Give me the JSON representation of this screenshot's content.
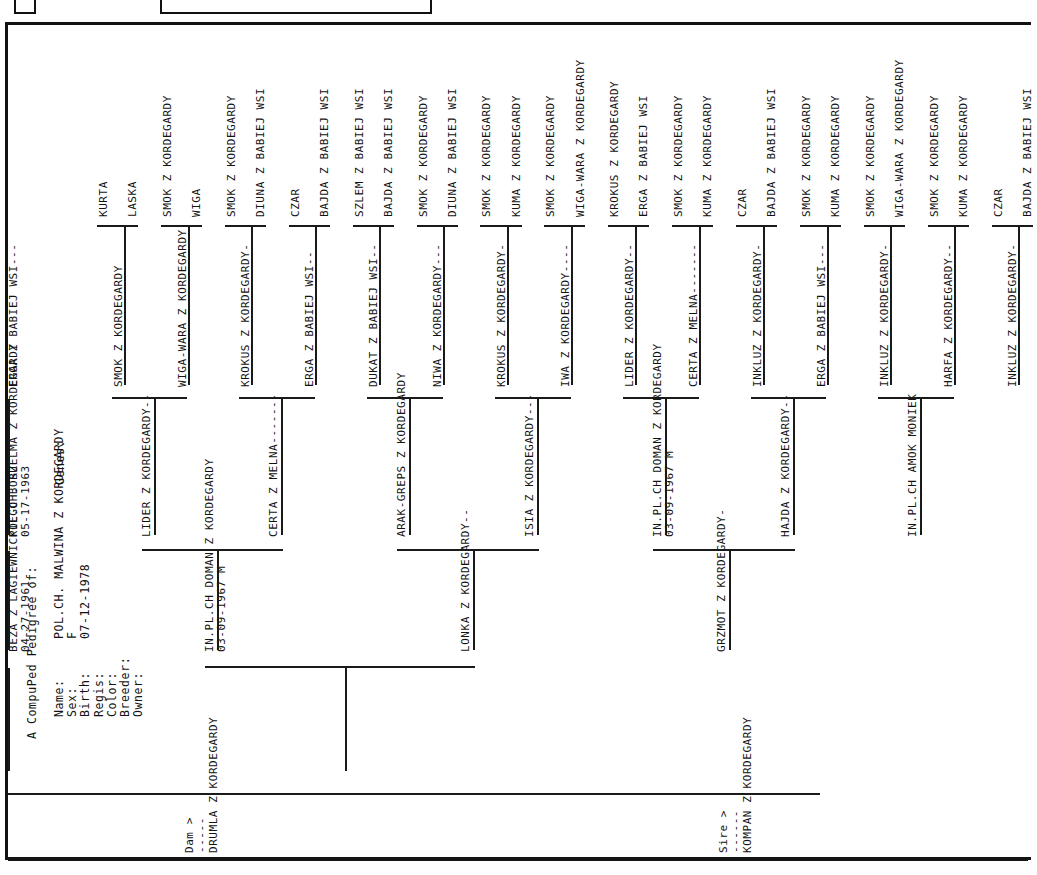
{
  "document": {
    "title": "A CompuPed Pedigree of:",
    "fields": [
      {
        "label": "Name:",
        "value": "POL.CH. MALWINA Z KORDEGARDY"
      },
      {
        "label": "Sex:",
        "value": "F"
      },
      {
        "label": "Birth:",
        "value": "07-12-1978"
      },
      {
        "label": "Regis:",
        "value": ""
      },
      {
        "label": "Color:",
        "value": ""
      },
      {
        "label": "Breeder:",
        "value": ""
      },
      {
        "label": "Owner:",
        "value": ""
      }
    ],
    "genes_label": "Genes:"
  },
  "sire_section": {
    "marker": "Sire >",
    "rule": "------",
    "name": "KOMPAN  Z  KORDEGARDY"
  },
  "dam_section": {
    "marker": "Dam >",
    "rule": "-----",
    "name": "DRUMLA  Z  KORDEGARDY"
  },
  "tree": {
    "gen2": [
      {
        "name": "IN.PL.CH DOMAN Z KORDEGARDY",
        "detail": "03-09-1967 M"
      },
      {
        "name": "LONKA Z KORDEGARDY--",
        "detail": ""
      },
      {
        "name": "GRZMOT Z KORDEGARDY-",
        "detail": ""
      },
      {
        "name": "BEZA Z LAGIEWNICKIEGO BORU",
        "detail": "04-27-1961"
      }
    ],
    "gen3": [
      {
        "name": "LIDER Z KORDEGARDY--",
        "detail": ""
      },
      {
        "name": "CERTA Z MELNA-------",
        "detail": ""
      },
      {
        "name": "ARAK-GREPS Z KORDEGARDY",
        "detail": ""
      },
      {
        "name": "ISIA Z KORDEGARDY---",
        "detail": ""
      },
      {
        "name": "IN.PL.CH DOMAN Z KORDEGARDY",
        "detail": "03-09-1967 M"
      },
      {
        "name": "HAJDA Z KORDEGARDY--",
        "detail": ""
      },
      {
        "name": "IN.PL.CH AMOK MONIEK",
        "detail": ""
      },
      {
        "name": "POL.CH. SZELMA Z KORDEGARDY",
        "detail": "05-17-1963"
      }
    ],
    "gen4": [
      "SMOK  Z  KORDEGARDY",
      "WIGA-WARA Z KORDEGARDY",
      "KROKUS Z KORDEGARDY-",
      "ERGA Z BABIEJ WSI--",
      "DUKAT Z BABIEJ WSI--",
      "NIWA Z KORDEGARDY---",
      "KROKUS Z KORDEGARDY-",
      "IWA Z KORDEGARDY----",
      "LIDER Z KORDEGARDY--",
      "CERTA Z MELNA-------",
      "INKLUZ Z KORDEGARDY-",
      "ERGA Z BABIEJ WSI---",
      "INKLUZ Z KORDEGARDY-",
      "HARFA Z KORDEGARDY--",
      "INKLUZ Z KORDEGARDY-",
      "ERGA Z BABIEJ WSI---"
    ],
    "gen5": [
      "KURTA",
      "LASKA",
      "SMOK  Z  KORDEGARDY",
      "WIGA",
      "SMOK  Z  KORDEGARDY",
      "DIUNA Z BABIEJ WSI",
      "CZAR",
      "BAJDA Z BABIEJ WSI",
      "SZLEM Z BABIEJ WSI",
      "BAJDA Z BABIEJ WSI",
      "SMOK  Z  KORDEGARDY",
      "DIUNA Z BABIEJ WSI",
      "SMOK  Z  KORDEGARDY",
      "KUMA  Z  KORDEGARDY",
      "SMOK  Z  KORDEGARDY",
      "WIGA-WARA Z KORDEGARDY",
      "KROKUS Z KORDEGARDY",
      "ERGA Z BABIEJ WSI",
      "SMOK  Z  KORDEGARDY",
      "KUMA  Z  KORDEGARDY",
      "CZAR",
      "BAJDA Z BABIEJ WSI",
      "SMOK  Z  KORDEGARDY",
      "KUMA  Z  KORDEGARDY",
      "SMOK  Z  KORDEGARDY",
      "WIGA-WARA Z KORDEGARDY",
      "SMOK  Z  KORDEGARDY",
      "KUMA  Z  KORDEGARDY",
      "CZAR",
      "BAJDA Z BABIEJ WSI"
    ]
  },
  "scan_artifacts": {
    "top_mark_left": "",
    "top_mark_center": "",
    "top_smudge_a": "",
    "top_smudge_b": "",
    "bottom_smudge": ""
  }
}
